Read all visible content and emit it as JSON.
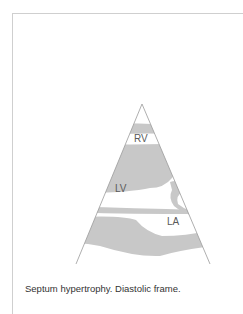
{
  "figure": {
    "labels": {
      "rv": "RV",
      "lv": "LV",
      "la": "LA"
    },
    "caption": "Septum hypertrophy. Diastolic frame.",
    "colors": {
      "tissue": "#c8c8c8",
      "outline": "#9a9a9a",
      "label": "#5a5a5a"
    }
  }
}
